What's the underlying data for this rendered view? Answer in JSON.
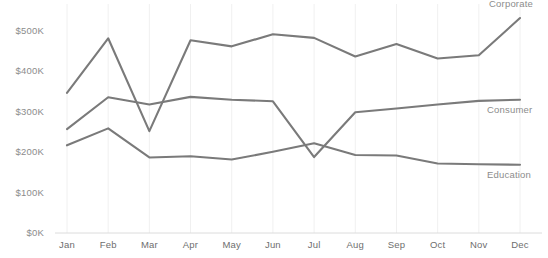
{
  "chart_data": {
    "type": "line",
    "title": "",
    "subtitle": "",
    "xlabel": "",
    "ylabel": "",
    "categories": [
      "Jan",
      "Feb",
      "Mar",
      "Apr",
      "May",
      "Jun",
      "Jul",
      "Aug",
      "Sep",
      "Oct",
      "Nov",
      "Dec"
    ],
    "ylim": [
      0,
      550000
    ],
    "ytick_values": [
      0,
      100000,
      200000,
      300000,
      400000,
      500000
    ],
    "ytick_labels": [
      "$0K",
      "$100K",
      "$200K",
      "$300K",
      "$400K",
      "$500K"
    ],
    "grid": "vertical-only",
    "legend_position": "right-inline-labels",
    "line_color": "#7a7a7a",
    "grid_color": "#f0f0f0",
    "label_color": "#8c8c8c",
    "axis_label_color": "#6e6e6e",
    "series": [
      {
        "name": "Corporate",
        "color": "#7a7a7a",
        "values": [
          347000,
          482000,
          252000,
          477000,
          462000,
          492000,
          483000,
          437000,
          468000,
          432000,
          440000,
          532000
        ]
      },
      {
        "name": "Consumer",
        "color": "#7a7a7a",
        "values": [
          257000,
          336000,
          318000,
          337000,
          330000,
          326000,
          188000,
          299000,
          308000,
          318000,
          327000,
          330000
        ]
      },
      {
        "name": "Education",
        "color": "#7a7a7a",
        "values": [
          217000,
          259000,
          187000,
          190000,
          182000,
          201000,
          222000,
          193000,
          192000,
          172000,
          170000,
          169000
        ]
      }
    ]
  },
  "axis": {
    "y_labels": [
      "$500K",
      "$400K",
      "$300K",
      "$200K",
      "$100K",
      "$0K"
    ],
    "x_labels": [
      "Jan",
      "Feb",
      "Mar",
      "Apr",
      "May",
      "Jun",
      "Jul",
      "Aug",
      "Sep",
      "Oct",
      "Nov",
      "Dec"
    ]
  },
  "series_labels": [
    {
      "name": "Corporate"
    },
    {
      "name": "Consumer"
    },
    {
      "name": "Education"
    }
  ]
}
